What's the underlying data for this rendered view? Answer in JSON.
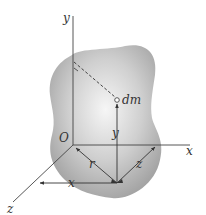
{
  "diagram": {
    "labels": {
      "y_axis": "y",
      "x_axis": "x",
      "z_axis": "z",
      "origin": "O",
      "mass_element": "dm",
      "r_dimension": "r",
      "x_dimension": "x",
      "y_dimension": "y",
      "z_dimension": "z"
    },
    "colors": {
      "body_fill_center": "#f4f4f4",
      "body_fill_edge": "#a8a8a8",
      "line": "#444444",
      "background": "#ffffff"
    }
  }
}
